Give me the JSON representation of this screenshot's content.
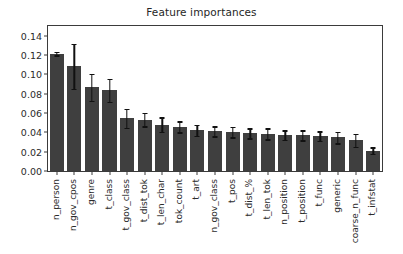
{
  "chart_data": {
    "type": "bar",
    "title": "Feature importances",
    "xlabel": "",
    "ylabel": "",
    "ylim": [
      0.0,
      0.15
    ],
    "yticks": [
      "0.00",
      "0.02",
      "0.04",
      "0.06",
      "0.08",
      "0.10",
      "0.12",
      "0.14"
    ],
    "ytick_values": [
      0.0,
      0.02,
      0.04,
      0.06,
      0.08,
      0.1,
      0.12,
      0.14
    ],
    "grid": false,
    "legend": null,
    "bar_color": "#3f3f3f",
    "error_color": "#111111",
    "categories": [
      "n_person",
      "n_gov_cpos",
      "genre",
      "t_class",
      "t_gov_class",
      "t_dist_tok",
      "t_len_char",
      "tok_count",
      "t_art",
      "n_gov_class",
      "t_pos",
      "t_dist_%",
      "t_len_tok",
      "n_position",
      "t_position",
      "t_func",
      "generic",
      "coarse_n_func",
      "t_infstat"
    ],
    "values": [
      0.1215,
      0.1083,
      0.0866,
      0.0833,
      0.0545,
      0.0532,
      0.048,
      0.0459,
      0.0421,
      0.041,
      0.0403,
      0.039,
      0.0384,
      0.0372,
      0.037,
      0.0362,
      0.0347,
      0.0317,
      0.0211
    ],
    "errors": [
      0.0018,
      0.0231,
      0.0137,
      0.0118,
      0.0096,
      0.007,
      0.0076,
      0.0057,
      0.0059,
      0.0051,
      0.0053,
      0.0053,
      0.0057,
      0.0051,
      0.0051,
      0.0049,
      0.006,
      0.0067,
      0.0036
    ]
  }
}
